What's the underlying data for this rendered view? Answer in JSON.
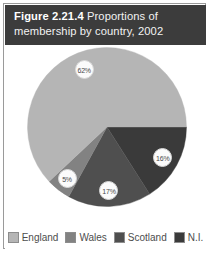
{
  "figure": {
    "number": "Figure 2.21.4",
    "caption": "Proportions of membership by country, 2002"
  },
  "chart_data": {
    "type": "pie",
    "title": "Figure 2.21.4 Proportions of membership by country, 2002",
    "xlabel": "",
    "ylabel": "",
    "legend_position": "bottom",
    "grid": false,
    "categories": [
      "England",
      "Wales",
      "Scotland",
      "N.I."
    ],
    "values": [
      62,
      5,
      17,
      16
    ],
    "labels": [
      "62%",
      "5%",
      "17%",
      "16%"
    ],
    "colors": [
      "#b5b5b5",
      "#828282",
      "#4f4f4f",
      "#3a3a3a"
    ],
    "slices": [
      {
        "name": "England",
        "value": 62,
        "label": "62%",
        "color": "#b5b5b5"
      },
      {
        "name": "Wales",
        "value": 5,
        "label": "5%",
        "color": "#828282"
      },
      {
        "name": "Scotland",
        "value": 17,
        "label": "17%",
        "color": "#4f4f4f"
      },
      {
        "name": "N.I.",
        "value": 16,
        "label": "16%",
        "color": "#3a3a3a"
      }
    ]
  },
  "legend": {
    "items": [
      {
        "label": "England",
        "color": "#b5b5b5"
      },
      {
        "label": "Wales",
        "color": "#828282"
      },
      {
        "label": "Scotland",
        "color": "#4f4f4f"
      },
      {
        "label": "N.I.",
        "color": "#3a3a3a"
      }
    ]
  },
  "colors": {
    "band_background": "#3c3c3c",
    "band_text": "#f2f2f2",
    "frame_border": "#9a9a9a",
    "page_background": "#ffffff"
  }
}
